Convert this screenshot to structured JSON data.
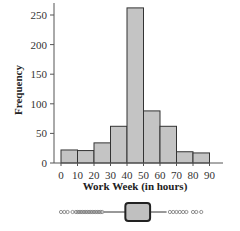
{
  "chart_data": {
    "type": "bar",
    "subtype": "histogram_with_boxplot",
    "title": "",
    "xlabel": "Work Week (in hours)",
    "ylabel": "Frequency",
    "x_ticks": [
      0,
      10,
      20,
      30,
      40,
      50,
      60,
      70,
      80,
      90
    ],
    "y_ticks": [
      0,
      50,
      100,
      150,
      200,
      250
    ],
    "ylim": [
      0,
      265
    ],
    "xlim": [
      0,
      100
    ],
    "bins": [
      {
        "from": 0,
        "to": 10,
        "value": 22
      },
      {
        "from": 10,
        "to": 20,
        "value": 21
      },
      {
        "from": 20,
        "to": 30,
        "value": 34
      },
      {
        "from": 30,
        "to": 40,
        "value": 62
      },
      {
        "from": 40,
        "to": 50,
        "value": 262
      },
      {
        "from": 50,
        "to": 60,
        "value": 88
      },
      {
        "from": 60,
        "to": 70,
        "value": 62
      },
      {
        "from": 70,
        "to": 80,
        "value": 19
      },
      {
        "from": 80,
        "to": 90,
        "value": 17
      }
    ],
    "categories": [
      "0-10",
      "10-20",
      "20-30",
      "30-40",
      "40-50",
      "50-60",
      "60-70",
      "70-80",
      "80-90"
    ],
    "values": [
      22,
      21,
      34,
      62,
      262,
      88,
      62,
      19,
      17
    ],
    "grid": false,
    "legend": null,
    "boxplot": {
      "q1": 39,
      "q3": 54,
      "whisker_low": 26,
      "whisker_high": 64,
      "outliers_low": [
        0,
        2,
        4,
        7,
        9,
        10,
        11,
        12,
        13,
        14,
        15,
        16,
        17,
        18,
        19,
        20,
        21,
        22,
        23,
        24,
        25
      ],
      "outliers_high": [
        66,
        68,
        70,
        72,
        74,
        76,
        80,
        82,
        85
      ]
    },
    "colors": {
      "bar_fill": "#c4c4c4",
      "bar_stroke": "#333333",
      "box_fill": "#c0c0c0"
    }
  },
  "labels": {
    "ylabel": "Frequency",
    "xlabel": "Work Week (in hours)"
  }
}
